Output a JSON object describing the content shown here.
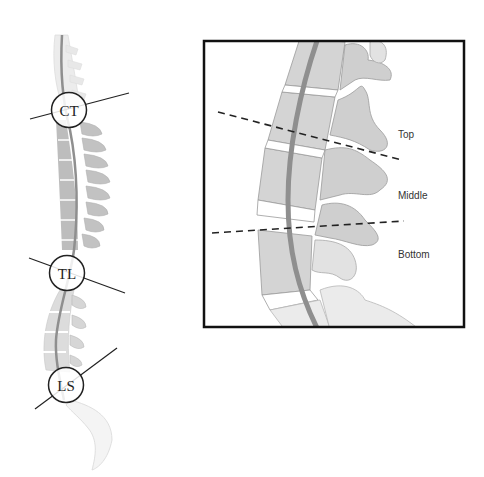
{
  "figure": {
    "left_panel": {
      "description": "Full spine side view with junction regions",
      "markers": [
        {
          "label": "CT",
          "cx": 69,
          "cy": 110
        },
        {
          "label": "TL",
          "cx": 67,
          "cy": 275
        },
        {
          "label": "LS",
          "cx": 67,
          "cy": 385
        }
      ]
    },
    "right_panel": {
      "description": "Zoomed junction view with dashed division lines",
      "zones": [
        {
          "label": "Top"
        },
        {
          "label": "Middle"
        },
        {
          "label": "Bottom"
        }
      ]
    },
    "colors": {
      "bone_dark": "#bdbdbd",
      "bone_light": "#dcdcdc",
      "bone_faint": "#ececec",
      "cord": "#8f8f8f",
      "outline": "#999999",
      "line": "#222222"
    }
  }
}
